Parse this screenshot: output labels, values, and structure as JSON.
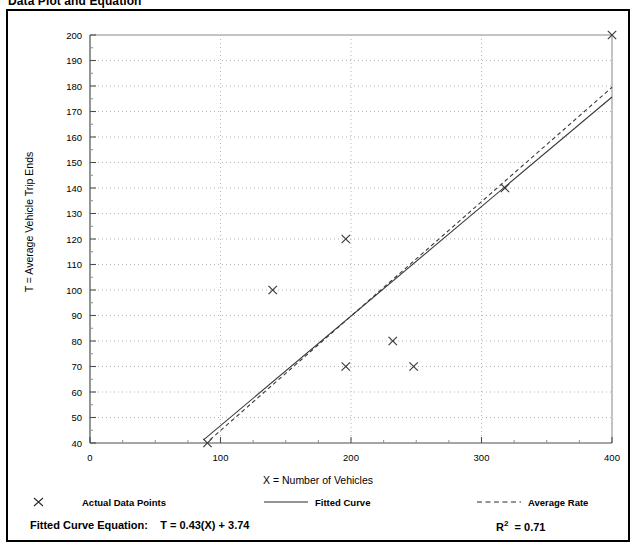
{
  "document": {
    "title": "Data Plot and Equation"
  },
  "chart_data": {
    "type": "scatter",
    "title": "Data Plot and Equation",
    "xlabel": "X = Number of Vehicles",
    "ylabel": "T = Average Vehicle Trip Ends",
    "xlim": [
      0,
      400
    ],
    "ylim": [
      40,
      200
    ],
    "xticks": [
      0,
      100,
      200,
      300,
      400
    ],
    "xtick_labels": [
      "0",
      "100",
      "200",
      "300",
      "400"
    ],
    "xminor_step": 25,
    "yticks": [
      40,
      50,
      60,
      70,
      80,
      90,
      100,
      110,
      120,
      130,
      140,
      150,
      160,
      170,
      180,
      190,
      200
    ],
    "ytick_labels": [
      "40",
      "50",
      "60",
      "70",
      "80",
      "90",
      "100",
      "110",
      "120",
      "130",
      "140",
      "150",
      "160",
      "170",
      "180",
      "190",
      "200"
    ],
    "grid": "dotted-both",
    "legend_position": "below-axes",
    "series": [
      {
        "name": "Actual Data Points",
        "type": "scatter",
        "marker": "x",
        "points": [
          {
            "x": 90,
            "y": 40
          },
          {
            "x": 140,
            "y": 100
          },
          {
            "x": 196,
            "y": 70
          },
          {
            "x": 196,
            "y": 120
          },
          {
            "x": 232,
            "y": 80
          },
          {
            "x": 248,
            "y": 70
          },
          {
            "x": 318,
            "y": 140
          },
          {
            "x": 400,
            "y": 200
          }
        ]
      },
      {
        "name": "Fitted Curve",
        "type": "line",
        "style": "solid",
        "equation": "T = 0.43(X) + 3.74",
        "slope": 0.43,
        "intercept": 3.74,
        "x_start": 87,
        "x_end": 400,
        "y_start": 41.2,
        "y_end": 175.7
      },
      {
        "name": "Average Rate",
        "type": "line",
        "style": "dashed",
        "slope": 0.4487,
        "intercept": 0,
        "x_start": 92,
        "x_end": 400,
        "y_start": 41.3,
        "y_end": 179.5
      }
    ]
  },
  "legend": {
    "items": [
      {
        "label": "Actual Data Points",
        "symbol": "x-marker"
      },
      {
        "label": "Fitted Curve",
        "symbol": "solid-line"
      },
      {
        "label": "Average Rate",
        "symbol": "dashed-line"
      }
    ]
  },
  "footer": {
    "equation_label": "Fitted Curve Equation:",
    "equation_value": "T = 0.43(X) + 3.74",
    "r_squared_prefix": "R",
    "r_squared_sup": "2",
    "r_squared_value": "= 0.71"
  },
  "colors": {
    "frame": "#000000",
    "grid": "#b6b6b6",
    "axis": "#555555",
    "series": "#3a3a3a"
  }
}
